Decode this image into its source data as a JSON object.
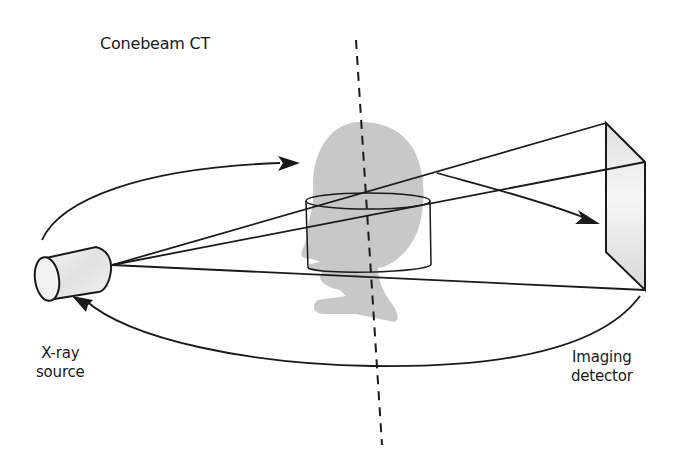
{
  "title": "Conebeam CT",
  "labels": {
    "source_line1": "X-ray",
    "source_line2": "source",
    "detector_line1": "Imaging",
    "detector_line2": "detector"
  },
  "colors": {
    "line": "#1a1a1a",
    "head": "#c8c8c8",
    "detector_fill": "#e4e4e4",
    "background": "#ffffff"
  },
  "components": [
    "x-ray-source",
    "head-silhouette",
    "cylindrical-field-of-view",
    "rotation-axis",
    "imaging-detector",
    "rotation-path-arrows",
    "x-ray-cone-beam"
  ]
}
